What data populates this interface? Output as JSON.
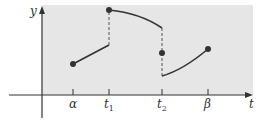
{
  "diagram": {
    "type": "piecewise-continuous-function",
    "colors": {
      "background": "#ffffff",
      "shaded_region": "#e6e6e6",
      "axis": "#333333",
      "curve": "#333333",
      "dash": "#555555"
    },
    "axes": {
      "y_label": "y",
      "x_label": "t"
    },
    "ticks": [
      {
        "name": "alpha",
        "label": "α",
        "sub": ""
      },
      {
        "name": "t1",
        "label": "t",
        "sub": "1"
      },
      {
        "name": "t2",
        "label": "t",
        "sub": "2"
      },
      {
        "name": "beta",
        "label": "β",
        "sub": ""
      }
    ],
    "segments": [
      {
        "from": "α",
        "to": "t1",
        "shape": "line",
        "start": "filled-dot",
        "end": "open"
      },
      {
        "from": "t1",
        "to": "t2",
        "shape": "concave-down-curve",
        "start": "filled-dot",
        "end": "open"
      },
      {
        "from": "t2",
        "to": "β",
        "shape": "concave-down-curve",
        "start": "open",
        "end": "filled-dot"
      }
    ],
    "isolated_points": [
      {
        "at": "t2",
        "description": "function value at t2 lies between left and right limits"
      }
    ],
    "jumps": [
      {
        "at": "t1",
        "style": "dashed",
        "direction": "up"
      },
      {
        "at": "t2",
        "style": "dashed",
        "direction": "down"
      }
    ]
  }
}
